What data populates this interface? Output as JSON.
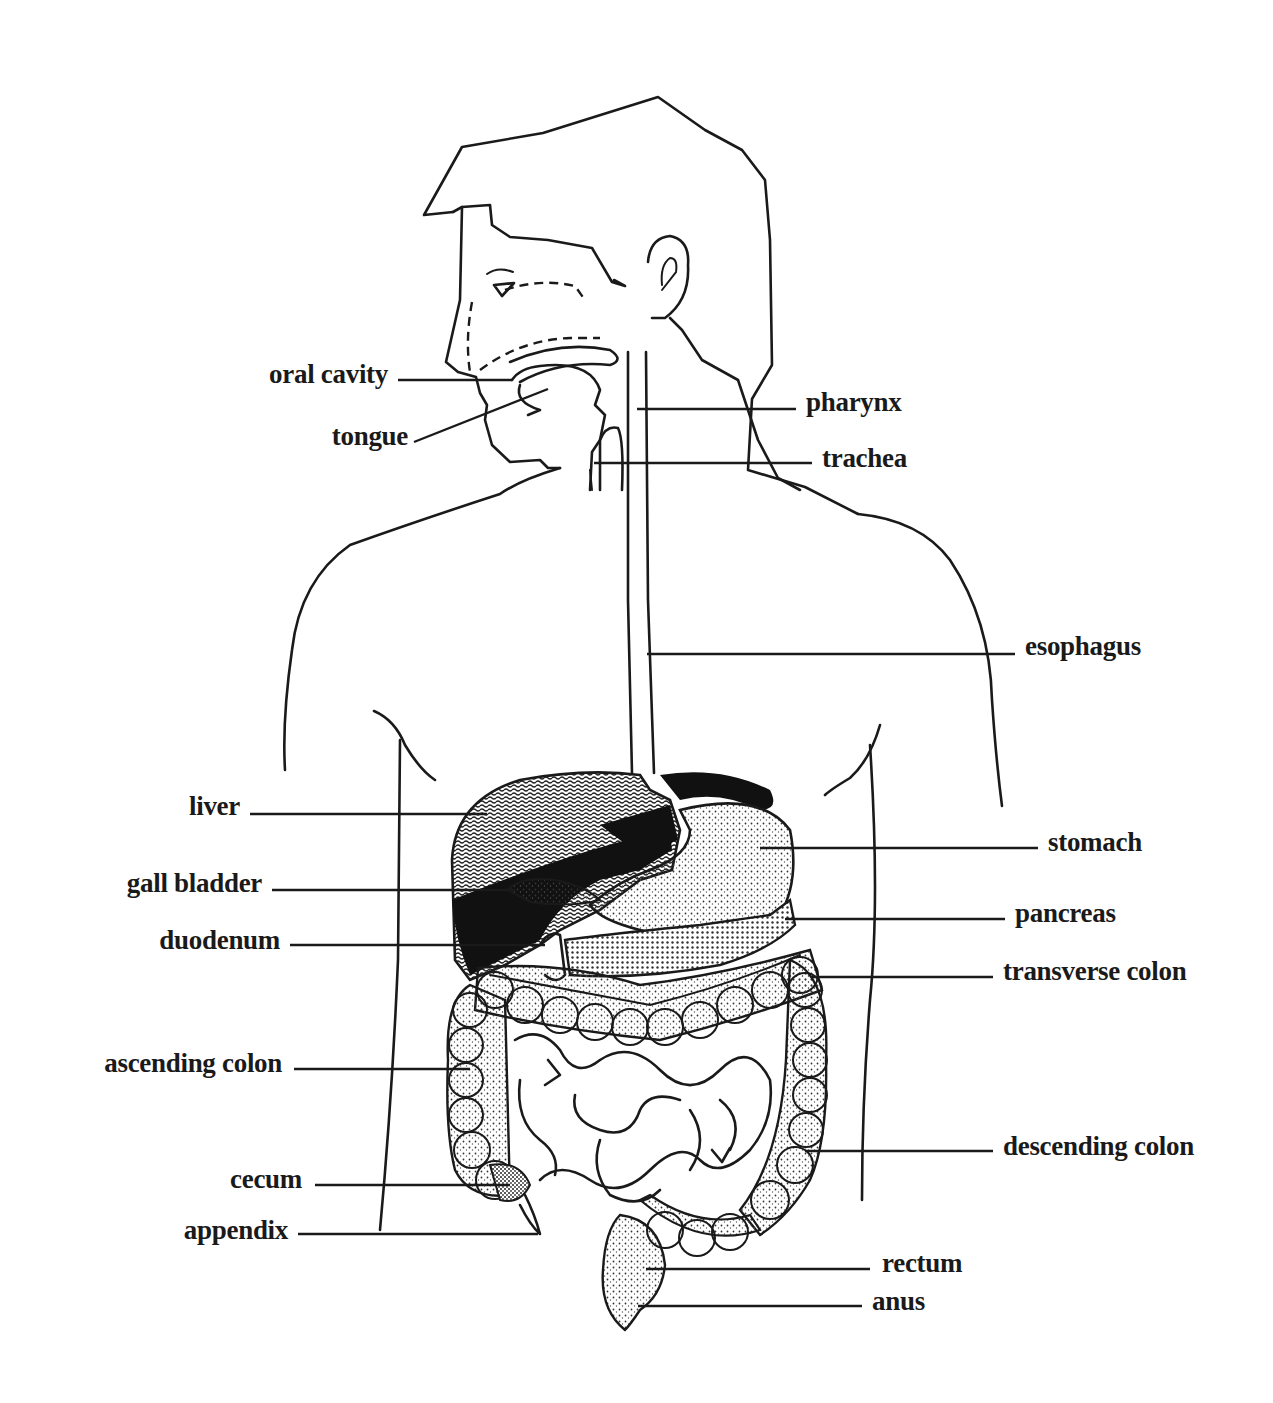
{
  "diagram": {
    "type": "labeled anatomical illustration",
    "colors": {
      "ink": "#1a1a1a",
      "background": "#ffffff",
      "stipple": "#555555"
    },
    "labels": [
      {
        "id": "oral-cavity",
        "text": "oral cavity",
        "side": "left",
        "text_right_x": 388,
        "y": 378,
        "line": {
          "x1": 398,
          "y1": 380,
          "x2": 512,
          "y2": 380
        }
      },
      {
        "id": "tongue",
        "text": "tongue",
        "side": "left",
        "text_right_x": 408,
        "y": 440,
        "line": {
          "x1": 414,
          "y1": 442,
          "x2": 548,
          "y2": 389
        }
      },
      {
        "id": "pharynx",
        "text": "pharynx",
        "side": "right",
        "text_left_x": 806,
        "y": 406,
        "line": {
          "x1": 637,
          "y1": 409,
          "x2": 796,
          "y2": 409
        }
      },
      {
        "id": "trachea",
        "text": "trachea",
        "side": "right",
        "text_left_x": 822,
        "y": 462,
        "line": {
          "x1": 594,
          "y1": 463,
          "x2": 812,
          "y2": 463
        }
      },
      {
        "id": "esophagus",
        "text": "esophagus",
        "side": "right",
        "text_left_x": 1025,
        "y": 650,
        "line": {
          "x1": 647,
          "y1": 654,
          "x2": 1015,
          "y2": 654
        }
      },
      {
        "id": "liver",
        "text": "liver",
        "side": "left",
        "text_right_x": 240,
        "y": 810,
        "line": {
          "x1": 250,
          "y1": 814,
          "x2": 487,
          "y2": 814
        }
      },
      {
        "id": "gall-bladder",
        "text": "gall bladder",
        "side": "left",
        "text_right_x": 262,
        "y": 887,
        "line": {
          "x1": 272,
          "y1": 890,
          "x2": 515,
          "y2": 890
        }
      },
      {
        "id": "duodenum",
        "text": "duodenum",
        "side": "left",
        "text_right_x": 280,
        "y": 944,
        "line": {
          "x1": 290,
          "y1": 945,
          "x2": 545,
          "y2": 945
        }
      },
      {
        "id": "stomach",
        "text": "stomach",
        "side": "right",
        "text_left_x": 1048,
        "y": 846,
        "line": {
          "x1": 760,
          "y1": 848,
          "x2": 1038,
          "y2": 848
        }
      },
      {
        "id": "pancreas",
        "text": "pancreas",
        "side": "right",
        "text_left_x": 1015,
        "y": 917,
        "line": {
          "x1": 785,
          "y1": 919,
          "x2": 1005,
          "y2": 919
        }
      },
      {
        "id": "transverse-colon",
        "text": "transverse colon",
        "side": "right",
        "text_left_x": 1003,
        "y": 975,
        "line": {
          "x1": 812,
          "y1": 977,
          "x2": 993,
          "y2": 977
        }
      },
      {
        "id": "ascending-colon",
        "text": "ascending colon",
        "side": "left",
        "text_right_x": 282,
        "y": 1067,
        "line": {
          "x1": 294,
          "y1": 1069,
          "x2": 470,
          "y2": 1069
        }
      },
      {
        "id": "descending-colon",
        "text": "descending colon",
        "side": "right",
        "text_left_x": 1003,
        "y": 1150,
        "line": {
          "x1": 805,
          "y1": 1151,
          "x2": 993,
          "y2": 1151
        }
      },
      {
        "id": "cecum",
        "text": "cecum",
        "side": "left",
        "text_right_x": 302,
        "y": 1183,
        "line": {
          "x1": 315,
          "y1": 1185,
          "x2": 510,
          "y2": 1185
        }
      },
      {
        "id": "appendix",
        "text": "appendix",
        "side": "left",
        "text_right_x": 288,
        "y": 1234,
        "line": {
          "x1": 298,
          "y1": 1234,
          "x2": 538,
          "y2": 1234
        }
      },
      {
        "id": "rectum",
        "text": "rectum",
        "side": "right",
        "text_left_x": 882,
        "y": 1267,
        "line": {
          "x1": 646,
          "y1": 1269,
          "x2": 870,
          "y2": 1269
        }
      },
      {
        "id": "anus",
        "text": "anus",
        "side": "right",
        "text_left_x": 872,
        "y": 1305,
        "line": {
          "x1": 638,
          "y1": 1306,
          "x2": 862,
          "y2": 1306
        }
      }
    ]
  }
}
